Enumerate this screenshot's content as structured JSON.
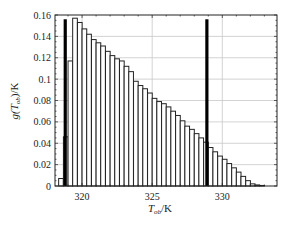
{
  "chart_data": {
    "type": "bar",
    "title": "",
    "xlabel": "T_ob/K",
    "xlabel_main": "T",
    "xlabel_sub": "ob",
    "xlabel_unit": "/K",
    "ylabel": "g(T_ob)/K",
    "ylabel_pre": "g(T",
    "ylabel_sub": "ob",
    "ylabel_post": ")/K",
    "xlim": [
      318.07,
      333.9
    ],
    "ylim": [
      0,
      0.16
    ],
    "xticks": [
      320,
      325,
      330
    ],
    "xtick_labels": [
      "320",
      "325",
      "330"
    ],
    "yticks": [
      0,
      0.02,
      0.04,
      0.06,
      0.08,
      0.1,
      0.12,
      0.14,
      0.16
    ],
    "ytick_labels": [
      "0",
      "0.02",
      "0.04",
      "0.06",
      "0.08",
      "0.1",
      "0.12",
      "0.14",
      "0.16"
    ],
    "grid": true,
    "bin_width": 0.3333,
    "bin_starts": [
      318.33,
      318.67,
      319.0,
      319.33,
      319.67,
      320.0,
      320.33,
      320.67,
      321.0,
      321.33,
      321.67,
      322.0,
      322.33,
      322.67,
      323.0,
      323.33,
      323.67,
      324.0,
      324.33,
      324.67,
      325.0,
      325.33,
      325.67,
      326.0,
      326.33,
      326.67,
      327.0,
      327.33,
      327.67,
      328.0,
      328.33,
      328.67,
      329.0,
      329.33,
      329.67,
      330.0,
      330.33,
      330.67,
      331.0,
      331.33,
      331.67,
      332.0,
      332.33,
      332.67
    ],
    "values": [
      0.007,
      0.046,
      0.117,
      0.157,
      0.153,
      0.147,
      0.142,
      0.137,
      0.134,
      0.131,
      0.126,
      0.122,
      0.119,
      0.117,
      0.112,
      0.107,
      0.098,
      0.094,
      0.091,
      0.087,
      0.082,
      0.079,
      0.077,
      0.074,
      0.07,
      0.066,
      0.061,
      0.056,
      0.053,
      0.049,
      0.045,
      0.041,
      0.036,
      0.032,
      0.028,
      0.025,
      0.021,
      0.017,
      0.013,
      0.009,
      0.005,
      0.002,
      0.001,
      0.0005
    ],
    "vertical_markers": [
      {
        "x": 318.8,
        "height": 0.156,
        "style": "thick"
      },
      {
        "x": 328.9,
        "height": 0.156,
        "style": "thick"
      }
    ],
    "colors": {
      "bar_fill": "#ffffff",
      "bar_edge": "#222222",
      "marker": "#000000",
      "grid": "#c8c8c8"
    }
  }
}
